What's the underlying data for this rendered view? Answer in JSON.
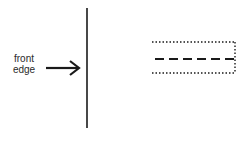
{
  "diagram": {
    "label": {
      "line1": "front",
      "line2": "edge"
    },
    "colors": {
      "ink": "#1a1a1a",
      "background": "#ffffff"
    },
    "elements": [
      {
        "type": "vertical-line",
        "x": 87,
        "y1": 8,
        "y2": 128
      },
      {
        "type": "arrow",
        "x1": 46,
        "x2": 79,
        "y": 68,
        "points_to": "vertical-line"
      },
      {
        "type": "dotted-rectangle-open-left",
        "x1": 152,
        "x2": 235,
        "y1": 42,
        "y2": 73
      },
      {
        "type": "dashed-centerline",
        "x1": 155,
        "x2": 235,
        "y": 59
      }
    ]
  }
}
